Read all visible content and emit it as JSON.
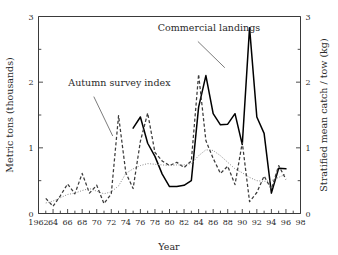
{
  "chart_data": {
    "type": "line",
    "title": "",
    "xlabel": "Year",
    "ylabel": "Metric tons (thousands)",
    "y2label": "Stratified mean catch / tow (kg)",
    "xlim": [
      1962,
      1998
    ],
    "ylim": [
      0,
      3
    ],
    "y2lim": [
      0,
      3
    ],
    "grid": false,
    "legend_position": "inline-annotations",
    "xticks": [
      1962,
      1964,
      1966,
      1968,
      1970,
      1972,
      1974,
      1976,
      1978,
      1980,
      1982,
      1984,
      1986,
      1988,
      1990,
      1992,
      1994,
      1996,
      1998
    ],
    "xtick_labels": [
      "1962",
      "64",
      "66",
      "68",
      "70",
      "72",
      "74",
      "76",
      "78",
      "80",
      "82",
      "84",
      "86",
      "88",
      "90",
      "92",
      "94",
      "96",
      "98"
    ],
    "xticks_minor_every": 1,
    "yticks": [
      0,
      1,
      2,
      3
    ],
    "ytick_labels": [
      "0",
      "1",
      "2",
      "3"
    ],
    "y2ticks": [
      0,
      1,
      2,
      3
    ],
    "y2tick_labels": [
      "0",
      "1",
      "2",
      "3"
    ],
    "yticks_minor": [
      0.5,
      1.5,
      2.5
    ],
    "annotations": [
      {
        "text": "Commercial landings",
        "target_series": "Commercial landings",
        "text_x": 1978.4,
        "text_y": 2.78,
        "leader_from_x": 1983.9,
        "leader_from_y": 2.62,
        "leader_to_x": 1987.6,
        "leader_to_y": 2.22
      },
      {
        "text": "Autumn survey index",
        "target_series": "Autumn survey index",
        "text_x": 1966.1,
        "text_y": 1.94,
        "leader_from_x": 1969.6,
        "leader_from_y": 1.78,
        "leader_to_x": 1972.2,
        "leader_to_y": 1.18
      }
    ],
    "series": [
      {
        "name": "Commercial landings",
        "axis": "left",
        "style": "solid",
        "color": "#000000",
        "x": [
          1975,
          1976,
          1977,
          1978,
          1979,
          1980,
          1981,
          1982,
          1983,
          1984,
          1985,
          1986,
          1987,
          1988,
          1989,
          1990,
          1991,
          1992,
          1993,
          1994,
          1995,
          1996
        ],
        "values": [
          1.3,
          1.47,
          1.07,
          0.87,
          0.6,
          0.41,
          0.41,
          0.43,
          0.5,
          1.62,
          2.1,
          1.52,
          1.35,
          1.36,
          1.52,
          1.05,
          2.83,
          1.47,
          1.22,
          0.31,
          0.69,
          0.68
        ]
      },
      {
        "name": "Autumn survey index",
        "axis": "right",
        "style": "dashed",
        "color": "#3b3b3b",
        "x": [
          1963,
          1964,
          1965,
          1966,
          1967,
          1968,
          1969,
          1970,
          1971,
          1972,
          1973,
          1974,
          1975,
          1976,
          1977,
          1978,
          1979,
          1980,
          1981,
          1982,
          1983,
          1984,
          1985,
          1986,
          1987,
          1988,
          1989,
          1990,
          1991,
          1992,
          1993,
          1994,
          1995,
          1996
        ],
        "values": [
          0.23,
          0.11,
          0.27,
          0.45,
          0.3,
          0.61,
          0.31,
          0.43,
          0.15,
          0.3,
          1.49,
          0.62,
          0.38,
          1.1,
          1.53,
          0.93,
          0.8,
          0.73,
          0.78,
          0.7,
          0.8,
          2.12,
          1.11,
          0.84,
          0.61,
          0.72,
          0.44,
          1.08,
          0.18,
          0.32,
          0.57,
          0.37,
          0.73,
          0.52
        ]
      },
      {
        "name": "Autumn survey index (smoothed)",
        "axis": "right",
        "style": "dotted",
        "color": "#8a8a8a",
        "x": [
          1963,
          1964,
          1965,
          1966,
          1967,
          1968,
          1969,
          1970,
          1971,
          1972,
          1973,
          1974,
          1975,
          1976,
          1977,
          1978,
          1979,
          1980,
          1981,
          1982,
          1983,
          1984,
          1985,
          1986,
          1987,
          1988,
          1989,
          1990,
          1991,
          1992,
          1993,
          1994,
          1995,
          1996
        ],
        "values": [
          0.16,
          0.19,
          0.24,
          0.29,
          0.31,
          0.35,
          0.38,
          0.34,
          0.3,
          0.33,
          0.42,
          0.61,
          0.68,
          0.73,
          0.76,
          0.75,
          0.74,
          0.73,
          0.74,
          0.74,
          0.76,
          0.88,
          0.97,
          0.96,
          0.88,
          0.78,
          0.68,
          0.62,
          0.55,
          0.5,
          0.49,
          0.5,
          0.55,
          0.6
        ]
      }
    ]
  }
}
